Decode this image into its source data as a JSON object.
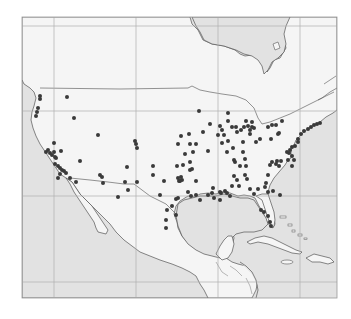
{
  "map": {
    "projection": "lambert-conformal",
    "region": "North America / Contiguous United States, Mexico, Central America, Caribbean",
    "colors": {
      "background": "#ffffff",
      "ocean": "#e2e2e2",
      "land": "#f5f5f5",
      "coastline": "#555555",
      "border": "#666666",
      "grid": "#b0b0b0",
      "frame": "#9a9a9a",
      "marker": "#3a3a3a"
    },
    "frame": {
      "x": 22,
      "y": 17,
      "w": 315,
      "h": 281
    },
    "gridlines": {
      "vertical_x": [
        54,
        136,
        218,
        300
      ],
      "horizontal_y": [
        26,
        111,
        196,
        282
      ]
    },
    "marker_radius": 2,
    "markers": [
      [
        40,
        96
      ],
      [
        40,
        99
      ],
      [
        38,
        108
      ],
      [
        37,
        112
      ],
      [
        36,
        116
      ],
      [
        67,
        97
      ],
      [
        74,
        118
      ],
      [
        98,
        135
      ],
      [
        54,
        143
      ],
      [
        48,
        150
      ],
      [
        50,
        153
      ],
      [
        52,
        155
      ],
      [
        54,
        152
      ],
      [
        46,
        152
      ],
      [
        55,
        157
      ],
      [
        61,
        151
      ],
      [
        56,
        158
      ],
      [
        55,
        164
      ],
      [
        58,
        166
      ],
      [
        60,
        168
      ],
      [
        62,
        170
      ],
      [
        64,
        171
      ],
      [
        66,
        173
      ],
      [
        60,
        174
      ],
      [
        58,
        178
      ],
      [
        70,
        178
      ],
      [
        76,
        182
      ],
      [
        80,
        161
      ],
      [
        100,
        175
      ],
      [
        102,
        177
      ],
      [
        103,
        183
      ],
      [
        127,
        167
      ],
      [
        135,
        141
      ],
      [
        136,
        144
      ],
      [
        137,
        148
      ],
      [
        153,
        166
      ],
      [
        153,
        175
      ],
      [
        164,
        181
      ],
      [
        177,
        166
      ],
      [
        178,
        178
      ],
      [
        180,
        181
      ],
      [
        181,
        177
      ],
      [
        183,
        165
      ],
      [
        185,
        154
      ],
      [
        192,
        169
      ],
      [
        196,
        181
      ],
      [
        208,
        151
      ],
      [
        199,
        111
      ],
      [
        228,
        113
      ],
      [
        228,
        121
      ],
      [
        222,
        130
      ],
      [
        224,
        135
      ],
      [
        228,
        141
      ],
      [
        232,
        127
      ],
      [
        236,
        127
      ],
      [
        241,
        130
      ],
      [
        244,
        127
      ],
      [
        248,
        126
      ],
      [
        250,
        130
      ],
      [
        252,
        127
      ],
      [
        252,
        122
      ],
      [
        246,
        121
      ],
      [
        237,
        132
      ],
      [
        243,
        142
      ],
      [
        243,
        152
      ],
      [
        245,
        159
      ],
      [
        240,
        166
      ],
      [
        256,
        142
      ],
      [
        260,
        139
      ],
      [
        233,
        148
      ],
      [
        235,
        162
      ],
      [
        234,
        176
      ],
      [
        247,
        179
      ],
      [
        246,
        166
      ],
      [
        237,
        180
      ],
      [
        245,
        175
      ],
      [
        210,
        124
      ],
      [
        203,
        132
      ],
      [
        189,
        134
      ],
      [
        181,
        136
      ],
      [
        178,
        144
      ],
      [
        190,
        144
      ],
      [
        196,
        144
      ],
      [
        193,
        152
      ],
      [
        190,
        162
      ],
      [
        190,
        170
      ],
      [
        227,
        152
      ],
      [
        234,
        160
      ],
      [
        222,
        143
      ],
      [
        218,
        135
      ],
      [
        220,
        126
      ],
      [
        250,
        134
      ],
      [
        254,
        128
      ],
      [
        268,
        127
      ],
      [
        272,
        125
      ],
      [
        276,
        125
      ],
      [
        282,
        121
      ],
      [
        279,
        133
      ],
      [
        278,
        134
      ],
      [
        271,
        139
      ],
      [
        298,
        139
      ],
      [
        301,
        134
      ],
      [
        304,
        131
      ],
      [
        308,
        129
      ],
      [
        311,
        127
      ],
      [
        314,
        125
      ],
      [
        317,
        124
      ],
      [
        320,
        123
      ],
      [
        298,
        142
      ],
      [
        295,
        146
      ],
      [
        292,
        147
      ],
      [
        290,
        150
      ],
      [
        289,
        153
      ],
      [
        287,
        152
      ],
      [
        292,
        156
      ],
      [
        294,
        160
      ],
      [
        292,
        166
      ],
      [
        288,
        160
      ],
      [
        272,
        162
      ],
      [
        276,
        164
      ],
      [
        277,
        161
      ],
      [
        281,
        161
      ],
      [
        279,
        166
      ],
      [
        270,
        165
      ],
      [
        268,
        175
      ],
      [
        266,
        183
      ],
      [
        268,
        192
      ],
      [
        213,
        188
      ],
      [
        221,
        193
      ],
      [
        225,
        191
      ],
      [
        232,
        186
      ],
      [
        239,
        186
      ],
      [
        250,
        189
      ],
      [
        258,
        189
      ],
      [
        265,
        187
      ],
      [
        254,
        194
      ],
      [
        273,
        191
      ],
      [
        280,
        195
      ],
      [
        212,
        193
      ],
      [
        208,
        195
      ],
      [
        196,
        195
      ],
      [
        191,
        196
      ],
      [
        188,
        192
      ],
      [
        176,
        199
      ],
      [
        172,
        206
      ],
      [
        167,
        210
      ],
      [
        166,
        220
      ],
      [
        176,
        215
      ],
      [
        166,
        228
      ],
      [
        214,
        198
      ],
      [
        227,
        193
      ],
      [
        261,
        210
      ],
      [
        264,
        212
      ],
      [
        268,
        216
      ],
      [
        270,
        222
      ],
      [
        271,
        226
      ],
      [
        220,
        192
      ],
      [
        179,
        181
      ],
      [
        182,
        180
      ],
      [
        200,
        200
      ],
      [
        220,
        200
      ],
      [
        230,
        196
      ],
      [
        160,
        195
      ],
      [
        178,
        198
      ],
      [
        118,
        197
      ],
      [
        128,
        190
      ],
      [
        137,
        182
      ],
      [
        125,
        182
      ]
    ]
  }
}
